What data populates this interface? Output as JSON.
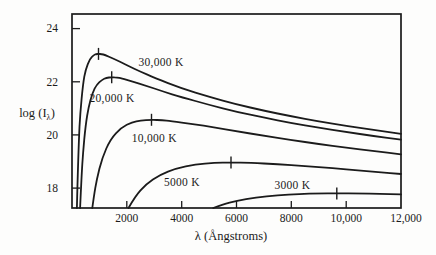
{
  "colors": {
    "ink": "#1b1b1b",
    "background": "#fdfdfc"
  },
  "chart_data": {
    "type": "line",
    "title": "",
    "xlabel": "λ (Ångstroms)",
    "ylabel": "log (Iλ)",
    "ylabel_parts": {
      "pre": "log (I",
      "sub": "λ",
      "post": ")"
    },
    "xlim": [
      0,
      12000
    ],
    "ylim": [
      17.25,
      24.55
    ],
    "grid": false,
    "legend_position": "inline-labels",
    "x_ticks": [
      {
        "value": 2000,
        "label": "2000",
        "tick": true
      },
      {
        "value": 4000,
        "label": "4000",
        "tick": true
      },
      {
        "value": 6000,
        "label": "6000",
        "tick": true
      },
      {
        "value": 8000,
        "label": "8000",
        "tick": true
      },
      {
        "value": 10000,
        "label": "10,000",
        "tick": true
      },
      {
        "value": 12000,
        "label": "12,000",
        "tick": false
      }
    ],
    "y_ticks": [
      {
        "value": 18,
        "label": "18"
      },
      {
        "value": 20,
        "label": "20"
      },
      {
        "value": 22,
        "label": "22"
      },
      {
        "value": 24,
        "label": "24"
      }
    ],
    "series": [
      {
        "name": "30,000 K",
        "temperature_K": 30000,
        "label_pos": [
          3250,
          22.74
        ],
        "peak_marker": [
          966,
          23.05
        ],
        "points": [
          [
            178,
            17.25
          ],
          [
            200,
            18.21
          ],
          [
            250,
            19.81
          ],
          [
            300,
            20.8
          ],
          [
            400,
            21.91
          ],
          [
            500,
            22.47
          ],
          [
            650,
            22.86
          ],
          [
            800,
            23.01
          ],
          [
            880,
            23.04
          ],
          [
            966,
            23.05
          ],
          [
            1080,
            23.04
          ],
          [
            1200,
            23.01
          ],
          [
            1500,
            22.88
          ],
          [
            2000,
            22.62
          ],
          [
            2500,
            22.38
          ],
          [
            3000,
            22.15
          ],
          [
            4000,
            21.75
          ],
          [
            5000,
            21.43
          ],
          [
            6000,
            21.15
          ],
          [
            7000,
            20.91
          ],
          [
            8000,
            20.7
          ],
          [
            9000,
            20.51
          ],
          [
            10000,
            20.34
          ],
          [
            11000,
            20.19
          ],
          [
            12000,
            20.04
          ]
        ]
      },
      {
        "name": "20,000 K",
        "temperature_K": 20000,
        "label_pos": [
          1460,
          21.39
        ],
        "peak_marker": [
          1449,
          22.17
        ],
        "points": [
          [
            297,
            17.25
          ],
          [
            350,
            18.48
          ],
          [
            400,
            19.31
          ],
          [
            500,
            20.39
          ],
          [
            600,
            21.03
          ],
          [
            750,
            21.59
          ],
          [
            900,
            21.89
          ],
          [
            1100,
            22.08
          ],
          [
            1250,
            22.15
          ],
          [
            1449,
            22.17
          ],
          [
            1650,
            22.16
          ],
          [
            1800,
            22.13
          ],
          [
            2200,
            22.01
          ],
          [
            2700,
            21.85
          ],
          [
            3300,
            21.64
          ],
          [
            4000,
            21.42
          ],
          [
            5000,
            21.13
          ],
          [
            6000,
            20.87
          ],
          [
            7000,
            20.65
          ],
          [
            8000,
            20.45
          ],
          [
            9000,
            20.27
          ],
          [
            10000,
            20.11
          ],
          [
            11000,
            19.96
          ],
          [
            12000,
            19.82
          ]
        ]
      },
      {
        "name": "10,000 K",
        "temperature_K": 10000,
        "label_pos": [
          3000,
          19.88
        ],
        "peak_marker": [
          2898,
          20.57
        ],
        "points": [
          [
            742,
            17.25
          ],
          [
            800,
            17.7
          ],
          [
            900,
            18.32
          ],
          [
            1100,
            19.14
          ],
          [
            1400,
            19.84
          ],
          [
            1800,
            20.28
          ],
          [
            2200,
            20.48
          ],
          [
            2500,
            20.54
          ],
          [
            2898,
            20.57
          ],
          [
            3300,
            20.55
          ],
          [
            3600,
            20.52
          ],
          [
            4400,
            20.41
          ],
          [
            5200,
            20.28
          ],
          [
            6000,
            20.14
          ],
          [
            7000,
            19.97
          ],
          [
            8000,
            19.81
          ],
          [
            9000,
            19.66
          ],
          [
            10000,
            19.52
          ],
          [
            11000,
            19.39
          ],
          [
            12000,
            19.27
          ]
        ]
      },
      {
        "name": "5000 K",
        "temperature_K": 5000,
        "label_pos": [
          4010,
          18.23
        ],
        "peak_marker": [
          5800,
          18.96
        ],
        "points": [
          [
            2060,
            17.25
          ],
          [
            2300,
            17.69
          ],
          [
            2700,
            18.14
          ],
          [
            3200,
            18.5
          ],
          [
            3800,
            18.74
          ],
          [
            4500,
            18.89
          ],
          [
            5200,
            18.95
          ],
          [
            5800,
            18.96
          ],
          [
            6500,
            18.95
          ],
          [
            7500,
            18.9
          ],
          [
            8500,
            18.83
          ],
          [
            9500,
            18.75
          ],
          [
            10500,
            18.66
          ],
          [
            11200,
            18.6
          ],
          [
            12000,
            18.53
          ]
        ]
      },
      {
        "name": "3000 K",
        "temperature_K": 3000,
        "label_pos": [
          8040,
          18.1
        ],
        "peak_marker": [
          9660,
          17.8
        ],
        "points": [
          [
            5150,
            17.25
          ],
          [
            5500,
            17.39
          ],
          [
            6000,
            17.52
          ],
          [
            6700,
            17.64
          ],
          [
            7500,
            17.73
          ],
          [
            8300,
            17.78
          ],
          [
            9000,
            17.8
          ],
          [
            9660,
            17.8
          ],
          [
            10500,
            17.8
          ],
          [
            11200,
            17.78
          ],
          [
            12000,
            17.76
          ]
        ]
      }
    ]
  }
}
